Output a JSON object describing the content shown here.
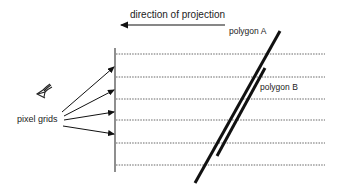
{
  "diagram": {
    "title": "direction of projection",
    "labels": {
      "polygon_a": "polygon A",
      "polygon_b": "polygon B",
      "pixel_grids": "pixel grids"
    },
    "icons": {
      "eye": "eye-icon"
    },
    "colors": {
      "ink": "#111111",
      "dotted": "#555555",
      "background": "#ffffff"
    },
    "grid_rows_y": [
      54,
      77,
      99,
      120,
      143,
      165
    ]
  }
}
